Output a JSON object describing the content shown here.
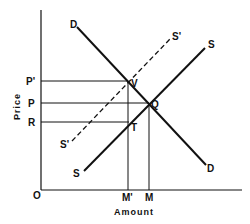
{
  "diagram": {
    "type": "supply-demand",
    "axes": {
      "y_label": "Price",
      "x_label": "Amount",
      "origin_label": "O"
    },
    "price_levels": [
      {
        "label": "P'",
        "name": "p-prime"
      },
      {
        "label": "P",
        "name": "p"
      },
      {
        "label": "R",
        "name": "r"
      }
    ],
    "quantity_levels": [
      {
        "label": "M'",
        "name": "m-prime"
      },
      {
        "label": "M",
        "name": "m"
      }
    ],
    "curves": {
      "demand": {
        "label_top": "D",
        "label_bottom": "D",
        "style": "solid"
      },
      "supply": {
        "label_top": "S",
        "label_bottom": "S",
        "style": "solid"
      },
      "supply_shifted": {
        "label_top": "S'",
        "label_bottom": "S'",
        "style": "dashed"
      }
    },
    "points": {
      "V": "V",
      "Q": "Q",
      "T": "T"
    },
    "colors": {
      "ink": "#111111",
      "background": "#ffffff"
    }
  }
}
